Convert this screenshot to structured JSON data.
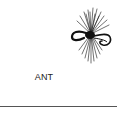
{
  "item": {
    "label": "ANT",
    "icon": "fly-fishing-lure-icon"
  },
  "colors": {
    "ink": "#111111",
    "rule": "#555555",
    "background": "#ffffff"
  }
}
